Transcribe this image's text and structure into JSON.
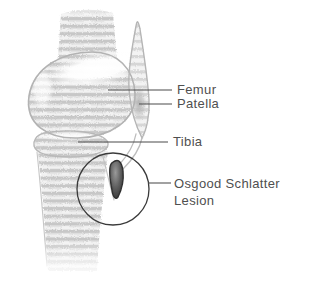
{
  "figure": {
    "kind": "medical-illustration",
    "labels": {
      "femur": "Femur",
      "patella": "Patella",
      "tibia": "Tibia",
      "lesion": "Osgood Schlatter Lesion"
    },
    "illustration_parts": [
      "femur-shaft",
      "femoral-condyle",
      "patella",
      "patellar-tendon",
      "tibial-plateau",
      "tibia-shaft",
      "osgood-schlatter-lesion",
      "annotation-circle"
    ],
    "colors": {
      "background": "#ffffff",
      "label_text": "#4f4f4f",
      "leader_line": "#4b4b4b",
      "annotation_circle": "#3a3a3a",
      "bone_outline": "#b3b3b3",
      "bone_texture_band": "#c7c7c7",
      "lesion_dark": "#303030"
    }
  }
}
